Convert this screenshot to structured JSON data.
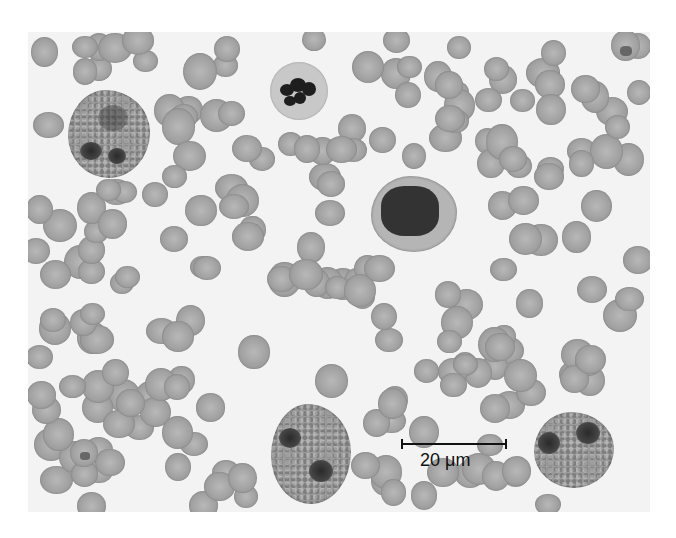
{
  "image": {
    "subject": "peripheral blood smear micrograph",
    "scale_bar": {
      "label": "20 μm"
    },
    "colors": {
      "background": "#f3f3f3",
      "rbc": "#a6a6a6",
      "nucleus": "#2a2a2a",
      "page": "#ffffff"
    }
  }
}
